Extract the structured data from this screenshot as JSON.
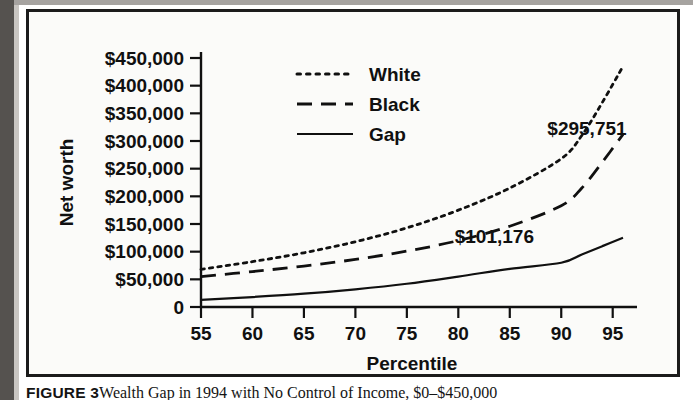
{
  "figure": {
    "caption_lead": "FIGURE 3",
    "caption_body": "Wealth Gap in 1994 with No Control of Income, $0–$450,000"
  },
  "chart_data": {
    "type": "line",
    "title": "",
    "xlabel": "Percentile",
    "ylabel": "Net worth",
    "xlim": [
      55,
      96
    ],
    "ylim": [
      0,
      450000
    ],
    "grid": false,
    "legend_position": "top-center",
    "xticks": [
      55,
      60,
      65,
      70,
      75,
      80,
      85,
      90,
      95
    ],
    "xtick_labels": [
      "55",
      "60",
      "65",
      "70",
      "75",
      "80",
      "85",
      "90",
      "95"
    ],
    "yticks": [
      0,
      50000,
      100000,
      150000,
      200000,
      250000,
      300000,
      350000,
      400000,
      450000
    ],
    "ytick_labels": [
      "0",
      "$50,000",
      "$100,000",
      "$150,000",
      "$200,000",
      "$250,000",
      "$300,000",
      "$350,000",
      "$400,000",
      "$450,000"
    ],
    "x": [
      55,
      60,
      65,
      70,
      75,
      80,
      85,
      90,
      92,
      94,
      96
    ],
    "series": [
      {
        "name": "White",
        "style": "dotted",
        "values": [
          68000,
          82000,
          98000,
          118000,
          143000,
          175000,
          215000,
          268000,
          310000,
          370000,
          435000
        ]
      },
      {
        "name": "Black",
        "style": "dashed",
        "values": [
          55000,
          64000,
          74000,
          86000,
          101000,
          120000,
          146000,
          183000,
          215000,
          262000,
          312000
        ]
      },
      {
        "name": "Gap",
        "style": "solid",
        "values": [
          13000,
          18000,
          24000,
          32000,
          42000,
          55000,
          69000,
          80000,
          95000,
          110000,
          125000
        ]
      }
    ],
    "annotations": [
      {
        "text": "$295,751",
        "x": 92.5,
        "y": 297000
      },
      {
        "text": "$101,176",
        "x": 83.5,
        "y": 101176
      }
    ]
  },
  "legend": {
    "entries": [
      {
        "label": "White",
        "style": "dotted"
      },
      {
        "label": "Black",
        "style": "dashed"
      },
      {
        "label": "Gap",
        "style": "solid"
      }
    ]
  },
  "colors": {
    "ink": "#101010",
    "frame": "#1b1b1b",
    "plot_bg": "#fbfbf9",
    "gutter": "#55524f"
  }
}
